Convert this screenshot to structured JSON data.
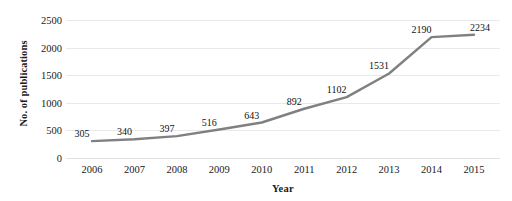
{
  "chart_data": {
    "type": "line",
    "title": "",
    "xlabel": "Year",
    "ylabel": "No. of publications",
    "categories": [
      "2006",
      "2007",
      "2008",
      "2009",
      "2010",
      "2011",
      "2012",
      "2013",
      "2014",
      "2015"
    ],
    "values": [
      305,
      340,
      397,
      516,
      643,
      892,
      1102,
      1531,
      2190,
      2234
    ],
    "series": [
      {
        "name": "No. of publications",
        "values": [
          305,
          340,
          397,
          516,
          643,
          892,
          1102,
          1531,
          2190,
          2234
        ]
      }
    ],
    "data_labels": [
      "305",
      "340",
      "397",
      "516",
      "643",
      "892",
      "1102",
      "1531",
      "2190",
      "2234"
    ],
    "ylim": [
      0,
      2500
    ],
    "y_ticks": [
      0,
      500,
      1000,
      1500,
      2000,
      2500
    ],
    "y_tick_labels": [
      "0",
      "500",
      "1000",
      "1500",
      "2000",
      "2500"
    ],
    "grid": "horizontal",
    "legend": "none",
    "line_color": "#808080",
    "line_width": 2.4,
    "markers": "none",
    "background_color": "#ffffff",
    "gridline_color": "#e9e9e9",
    "text_color": "#1a1a1a"
  }
}
